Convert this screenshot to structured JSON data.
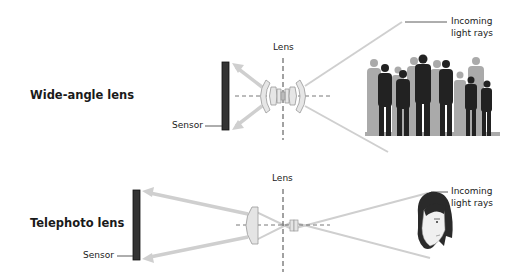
{
  "wide_angle": {
    "title": "Wide-angle lens",
    "lens_label": "Lens",
    "sensor_label": "Sensor",
    "incoming_label_line1": "Incoming",
    "incoming_label_line2": "light rays",
    "subject": "group-of-people-silhouettes"
  },
  "telephoto": {
    "title": "Telephoto lens",
    "lens_label": "Lens",
    "sensor_label": "Sensor",
    "incoming_label_line1": "Incoming",
    "incoming_label_line2": "light rays",
    "subject": "head-portrait"
  },
  "colors": {
    "ray": "#cfcfcf",
    "sensor": "#333333",
    "lens_fill": "#e4e4e4",
    "lens_stroke": "#9a9a9a",
    "silhouette_dark": "#222222",
    "silhouette_light": "#aaaaaa"
  }
}
